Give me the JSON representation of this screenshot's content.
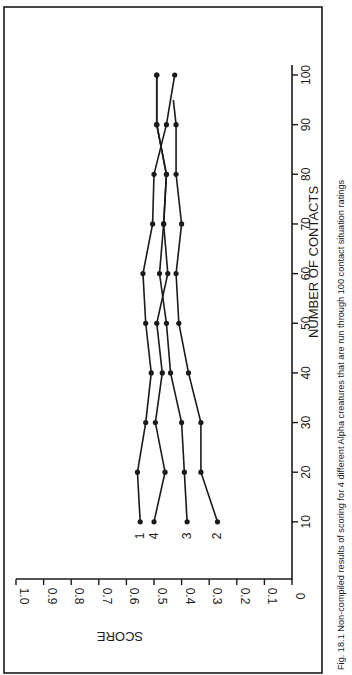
{
  "figure": {
    "caption": "Fig. 18.1  Non-compiled results of scoring for 4 different Alpha creatures that are run through 100 contact situation ratings"
  },
  "chart_data": {
    "type": "line",
    "title": "",
    "xlabel": "NUMBER OF CONTACTS",
    "ylabel": "SCORE",
    "x": [
      10,
      20,
      30,
      40,
      50,
      60,
      70,
      80,
      90,
      100
    ],
    "x_ticks": [
      "10",
      "20",
      "30",
      "40",
      "50",
      "60",
      "70",
      "80",
      "90",
      "100"
    ],
    "y_ticks": [
      "0",
      "0.1",
      "0.2",
      "0.3",
      "0.4",
      "0.5",
      "0.6",
      "0.7",
      "0.8",
      "0.9",
      "1.0"
    ],
    "xlim": [
      0,
      105
    ],
    "ylim": [
      0,
      1.0
    ],
    "grid": false,
    "legend": "inline labels at start of each series (1, 4, 3, 2)",
    "orientation": "rotated 90° counter-clockwise on page",
    "series": [
      {
        "name": "1",
        "values": [
          0.55,
          0.56,
          0.53,
          0.51,
          0.53,
          0.54,
          0.505,
          0.5,
          0.455,
          0.425
        ]
      },
      {
        "name": "2",
        "values": [
          0.27,
          0.33,
          0.33,
          0.375,
          0.41,
          0.42,
          0.4,
          0.42,
          0.42,
          null
        ],
        "end_unmarked": {
          "x": 95,
          "y": 0.43
        }
      },
      {
        "name": "3",
        "values": [
          0.38,
          0.39,
          0.4,
          0.44,
          0.455,
          0.48,
          0.465,
          0.455,
          0.49,
          0.49
        ]
      },
      {
        "name": "4",
        "values": [
          0.5,
          0.46,
          0.495,
          0.47,
          0.49,
          0.45,
          0.465,
          0.455,
          0.49,
          0.49
        ]
      }
    ]
  }
}
